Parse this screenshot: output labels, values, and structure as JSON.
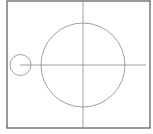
{
  "diagram": {
    "canvas": {
      "width": 153,
      "height": 134,
      "background": "#ffffff"
    },
    "frame": {
      "x": 7,
      "y": 1,
      "width": 143,
      "height": 127,
      "stroke": "#555555",
      "stroke_width": 1.2
    },
    "vertical_axis": {
      "x": 83,
      "y1": 1,
      "y2": 128,
      "stroke": "#888888"
    },
    "horizontal_axis": {
      "x1": 20,
      "x2": 146,
      "y": 65,
      "stroke": "#888888"
    },
    "large_circle": {
      "cx": 83,
      "cy": 65,
      "r": 42,
      "stroke": "#888888"
    },
    "small_circle": {
      "cx": 20.5,
      "cy": 65,
      "r": 10.5,
      "stroke": "#888888"
    }
  }
}
